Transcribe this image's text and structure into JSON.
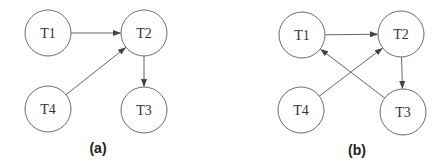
{
  "diagrams": [
    {
      "id": "a",
      "caption": "(a)",
      "caption_pos": [
        98,
        148
      ],
      "nodes": [
        {
          "id": "T1",
          "label": "T1",
          "x": 48,
          "y": 33
        },
        {
          "id": "T2",
          "label": "T2",
          "x": 144,
          "y": 33
        },
        {
          "id": "T4",
          "label": "T4",
          "x": 48,
          "y": 109
        },
        {
          "id": "T3",
          "label": "T3",
          "x": 144,
          "y": 110
        }
      ],
      "edges": [
        {
          "from": "T1",
          "to": "T2"
        },
        {
          "from": "T4",
          "to": "T2"
        },
        {
          "from": "T2",
          "to": "T3"
        }
      ]
    },
    {
      "id": "b",
      "caption": "(b)",
      "caption_pos": [
        357,
        150
      ],
      "nodes": [
        {
          "id": "T1",
          "label": "T1",
          "x": 302,
          "y": 35
        },
        {
          "id": "T2",
          "label": "T2",
          "x": 401,
          "y": 34
        },
        {
          "id": "T4",
          "label": "T4",
          "x": 301,
          "y": 110
        },
        {
          "id": "T3",
          "label": "T3",
          "x": 403,
          "y": 112
        }
      ],
      "edges": [
        {
          "from": "T1",
          "to": "T2"
        },
        {
          "from": "T4",
          "to": "T2"
        },
        {
          "from": "T2",
          "to": "T3"
        },
        {
          "from": "T3",
          "to": "T1"
        }
      ]
    }
  ],
  "style": {
    "node_radius": 23,
    "stroke_color": "#6a6a6a",
    "edge_color": "#555555"
  }
}
